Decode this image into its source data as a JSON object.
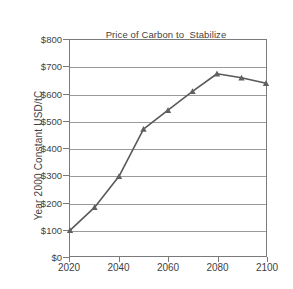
{
  "chart_data": {
    "type": "line",
    "title": "Price of Carbon to  Stabilize Radiative Forcing at 3.4 W/m2",
    "title_line1": "Price of Carbon to  Stabilize",
    "title_line2_prefix": "Radiative Forcing at 3.4 W/m",
    "title_line2_sup": "2",
    "xlabel": "",
    "ylabel": "Year 2000 Constant USD/tC",
    "x": [
      2020,
      2030,
      2040,
      2050,
      2060,
      2070,
      2080,
      2090,
      2100
    ],
    "values": [
      95,
      180,
      295,
      470,
      540,
      610,
      675,
      660,
      640
    ],
    "categories": [
      "2020",
      "2030",
      "2040",
      "2050",
      "2060",
      "2070",
      "2080",
      "2090",
      "2100"
    ],
    "xlim": [
      2020,
      2100
    ],
    "ylim": [
      0,
      800
    ],
    "y_ticks": [
      0,
      100,
      200,
      300,
      400,
      500,
      600,
      700,
      800
    ],
    "y_tick_labels": [
      "$0",
      "$100",
      "$200",
      "$300",
      "$400",
      "$500",
      "$600",
      "$700",
      "$800"
    ],
    "x_ticks": [
      2020,
      2040,
      2060,
      2080,
      2100
    ],
    "x_tick_labels": [
      "2020",
      "2040",
      "2060",
      "2080",
      "2100"
    ],
    "grid": "horizontal",
    "legend": "none",
    "marker": "triangle",
    "series_color": "#595959",
    "marker_color": "#606060",
    "gridline_color": "#9a9a9a",
    "axis_color": "#7a7a7a",
    "background_color": "#ffffff",
    "text_color": "#3f3f3f"
  }
}
